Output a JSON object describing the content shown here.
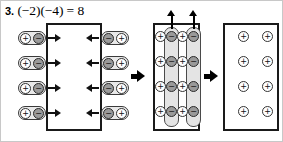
{
  "problem": {
    "number": "3.",
    "expression": "(−2)(−4) = 8",
    "full_label": "3. (−2)(−4) = 8"
  },
  "glyphs": {
    "positive": "⊕",
    "negative": "⊖",
    "plus": "+",
    "minus": "−",
    "arrow_right": "→",
    "arrow_left": "←",
    "arrow_up": "↑"
  },
  "colors": {
    "ink": "#000000",
    "frame": "#1a1a1a",
    "positive_fill": "#ffffff",
    "negative_fill": "#9a9a9a",
    "pill_fill": "#e8e8e8",
    "tube_fill": "#e4e4e4",
    "page_border": "#c8c8c8",
    "background": "#ffffff"
  },
  "stages": [
    {
      "name": "stage-1-insert-zero-pairs",
      "box_label": "",
      "box_contents_count": 0,
      "left_feed": {
        "count": 4,
        "direction": "right",
        "pill_order": [
          "positive",
          "negative"
        ],
        "pills": [
          {
            "a": "+",
            "b": "−"
          },
          {
            "a": "+",
            "b": "−"
          },
          {
            "a": "+",
            "b": "−"
          },
          {
            "a": "+",
            "b": "−"
          }
        ]
      },
      "right_feed": {
        "count": 4,
        "direction": "left",
        "pill_order": [
          "negative",
          "positive"
        ],
        "pills": [
          {
            "a": "−",
            "b": "+"
          },
          {
            "a": "−",
            "b": "+"
          },
          {
            "a": "−",
            "b": "+"
          },
          {
            "a": "−",
            "b": "+"
          }
        ]
      }
    },
    {
      "name": "stage-2-remove-negatives",
      "rows": 4,
      "columns": 4,
      "column_signs": [
        "+",
        "−",
        "+",
        "−"
      ],
      "grid": [
        [
          "+",
          "−",
          "+",
          "−"
        ],
        [
          "+",
          "−",
          "+",
          "−"
        ],
        [
          "+",
          "−",
          "+",
          "−"
        ],
        [
          "+",
          "−",
          "+",
          "−"
        ]
      ],
      "removal_tubes": 2,
      "removal_tube_columns": [
        2,
        4
      ],
      "up_arrows": 2,
      "positives_count": 8,
      "negatives_count": 8
    },
    {
      "name": "stage-3-result",
      "rows": 4,
      "columns": 2,
      "grid": [
        [
          "+",
          "+"
        ],
        [
          "+",
          "+"
        ],
        [
          "+",
          "+"
        ],
        [
          "+",
          "+"
        ]
      ],
      "result_count": 8,
      "result_sign": "+"
    }
  ],
  "transitions": [
    {
      "name": "arrow-stage1-to-stage2",
      "direction": "right"
    },
    {
      "name": "arrow-stage2-to-stage3",
      "direction": "right"
    }
  ]
}
